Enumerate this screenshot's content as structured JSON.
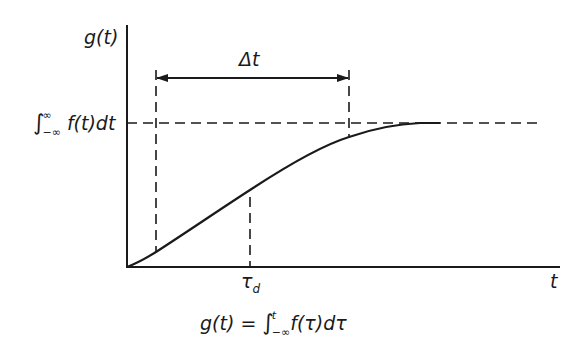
{
  "diagram": {
    "y_axis_label": "g(t)",
    "x_axis_label": "t",
    "interval_label": "Δt",
    "delay_label_main": "τ",
    "delay_label_sub": "d",
    "asymptote_label": {
      "integral_sign": "∫",
      "upper": "∞",
      "lower": "−∞",
      "integrand": "f(t)dt"
    },
    "formula": {
      "lhs": "g(t) = ",
      "integral_sign": "∫",
      "upper": "t",
      "lower": "−∞",
      "integrand": "f(τ)dτ"
    },
    "line_color": "#1a1a1a",
    "background": "#ffffff"
  }
}
